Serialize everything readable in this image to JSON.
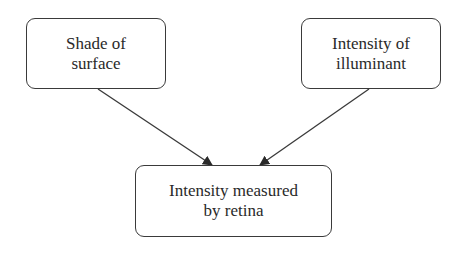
{
  "diagram": {
    "nodes": [
      {
        "id": "shade",
        "lines": [
          "Shade of",
          "surface"
        ]
      },
      {
        "id": "illuminant",
        "lines": [
          "Intensity of",
          "illuminant"
        ]
      },
      {
        "id": "retina",
        "lines": [
          "Intensity measured",
          "by retina"
        ]
      }
    ],
    "edges": [
      {
        "from": "shade",
        "to": "retina"
      },
      {
        "from": "illuminant",
        "to": "retina"
      }
    ],
    "colors": {
      "stroke": "#3a3a3a",
      "text": "#2a2a2a",
      "background": "#ffffff"
    }
  }
}
